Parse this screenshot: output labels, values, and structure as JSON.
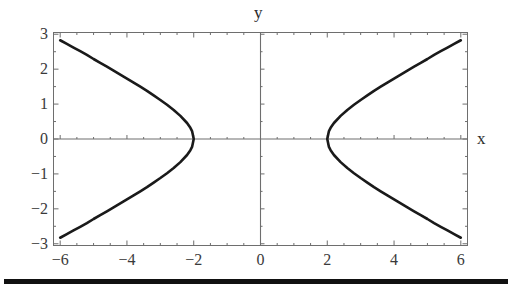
{
  "figure": {
    "name": "hyperbola-plot",
    "background": "#ffffff",
    "curve_color": "#1a1a1a",
    "frame_color": "#6e6e6e",
    "axis_color": "#6e6e6e",
    "text_color": "#333333"
  },
  "labels": {
    "x_axis": "x",
    "y_axis": "y"
  },
  "chart_data": {
    "type": "line",
    "title": "",
    "xlabel": "x",
    "ylabel": "y",
    "xlim": [
      -6.2,
      6.2
    ],
    "ylim": [
      -3.05,
      3.05
    ],
    "grid": false,
    "legend": null,
    "equation": "x^2/4 - y^2 = 1",
    "xticks": [
      -6,
      -4,
      -2,
      0,
      2,
      4,
      6
    ],
    "xtick_labels": [
      "-6",
      "-4",
      "-2",
      "0",
      "2",
      "4",
      "6"
    ],
    "yticks": [
      -3,
      -2,
      -1,
      0,
      1,
      2,
      3
    ],
    "ytick_labels": [
      "-3",
      "-2",
      "-1",
      "0",
      "1",
      "2",
      "3"
    ],
    "minor_tick_step": 0.5,
    "vertices": [
      [
        -2,
        0
      ],
      [
        2,
        0
      ]
    ],
    "series": [
      {
        "name": "left-branch",
        "x": [
          -6.0,
          -5.8,
          -5.6,
          -5.4,
          -5.2,
          -5.0,
          -4.8,
          -4.6,
          -4.4,
          -4.2,
          -4.0,
          -3.8,
          -3.6,
          -3.4,
          -3.2,
          -3.0,
          -2.8,
          -2.6,
          -2.4,
          -2.2,
          -2.1,
          -2.05,
          -2.0,
          -2.05,
          -2.1,
          -2.2,
          -2.4,
          -2.6,
          -2.8,
          -3.0,
          -3.2,
          -3.4,
          -3.6,
          -3.8,
          -4.0,
          -4.2,
          -4.4,
          -4.6,
          -4.8,
          -5.0,
          -5.2,
          -5.4,
          -5.6,
          -5.8,
          -6.0
        ],
        "y": [
          2.828,
          2.724,
          2.619,
          2.514,
          2.408,
          2.291,
          2.182,
          2.071,
          1.959,
          1.846,
          1.732,
          1.616,
          1.498,
          1.378,
          1.249,
          1.118,
          0.98,
          0.833,
          0.663,
          0.458,
          0.32,
          0.227,
          0.0,
          -0.227,
          -0.32,
          -0.458,
          -0.663,
          -0.833,
          -0.98,
          -1.118,
          -1.249,
          -1.378,
          -1.498,
          -1.616,
          -1.732,
          -1.846,
          -1.959,
          -2.071,
          -2.182,
          -2.291,
          -2.408,
          -2.514,
          -2.619,
          -2.724,
          -2.828
        ]
      },
      {
        "name": "right-branch",
        "x": [
          6.0,
          5.8,
          5.6,
          5.4,
          5.2,
          5.0,
          4.8,
          4.6,
          4.4,
          4.2,
          4.0,
          3.8,
          3.6,
          3.4,
          3.2,
          3.0,
          2.8,
          2.6,
          2.4,
          2.2,
          2.1,
          2.05,
          2.0,
          2.05,
          2.1,
          2.2,
          2.4,
          2.6,
          2.8,
          3.0,
          3.2,
          3.4,
          3.6,
          3.8,
          4.0,
          4.2,
          4.4,
          4.6,
          4.8,
          5.0,
          5.2,
          5.4,
          5.6,
          5.8,
          6.0
        ],
        "y": [
          2.828,
          2.724,
          2.619,
          2.514,
          2.408,
          2.291,
          2.182,
          2.071,
          1.959,
          1.846,
          1.732,
          1.616,
          1.498,
          1.378,
          1.249,
          1.118,
          0.98,
          0.833,
          0.663,
          0.458,
          0.32,
          0.227,
          0.0,
          -0.227,
          -0.32,
          -0.458,
          -0.663,
          -0.833,
          -0.98,
          -1.118,
          -1.249,
          -1.378,
          -1.498,
          -1.616,
          -1.732,
          -1.846,
          -1.959,
          -2.071,
          -2.182,
          -2.291,
          -2.408,
          -2.514,
          -2.619,
          -2.724,
          -2.828
        ]
      }
    ]
  },
  "footer_rule": {
    "present": true
  }
}
